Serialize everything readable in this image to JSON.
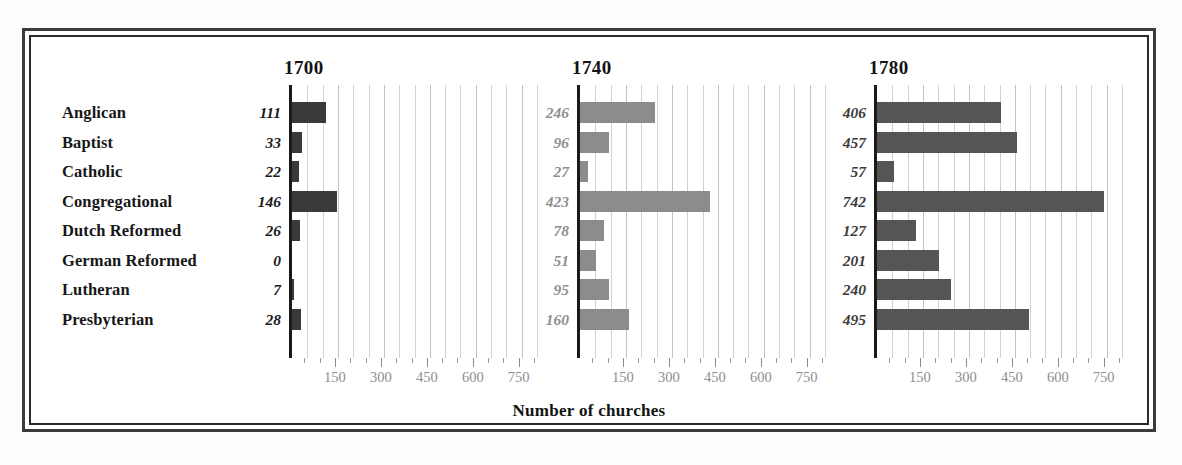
{
  "figure": {
    "axis_caption": "Number of churches",
    "frame": true
  },
  "chart_data": {
    "type": "bar",
    "title": "",
    "subtitle": "",
    "xlabel": "Number of churches",
    "ylabel": "",
    "orientation": "horizontal",
    "panel_layout": "small-multiples",
    "grid": true,
    "grid_interval": 50,
    "legend": "none",
    "xlim": [
      0,
      800
    ],
    "xticks": [
      150,
      300,
      450,
      600,
      750
    ],
    "xtick_labels": [
      "150",
      "300",
      "450",
      "600",
      "750"
    ],
    "categories": [
      "Anglican",
      "Baptist",
      "Catholic",
      "Congregational",
      "Dutch Reformed",
      "German Reformed",
      "Lutheran",
      "Presbyterian"
    ],
    "panels": [
      {
        "year": "1700",
        "bar_color": "#3a3a3a",
        "label_color": "#1a1a1a",
        "values": [
          111,
          33,
          22,
          146,
          26,
          0,
          7,
          28
        ],
        "value_labels": [
          "111",
          "33",
          "22",
          "146",
          "26",
          "0",
          "7",
          "28"
        ]
      },
      {
        "year": "1740",
        "bar_color": "#8c8c8c",
        "label_color": "#8f8f8f",
        "values": [
          246,
          96,
          27,
          423,
          78,
          51,
          95,
          160
        ],
        "value_labels": [
          "246",
          "96",
          "27",
          "423",
          "78",
          "51",
          "95",
          "160"
        ]
      },
      {
        "year": "1780",
        "bar_color": "#555555",
        "label_color": "#3c3c3c",
        "values": [
          406,
          457,
          57,
          742,
          127,
          201,
          240,
          495
        ],
        "value_labels": [
          "406",
          "457",
          "57",
          "742",
          "127",
          "201",
          "240",
          "495"
        ]
      }
    ]
  },
  "colors": {
    "frame": "#2a2a2a",
    "axis": "#1a1a1a",
    "gridline": "#d2d2d2",
    "tick_label": "#8e8e8e",
    "background": "#ffffff"
  }
}
